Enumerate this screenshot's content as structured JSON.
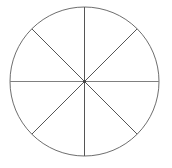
{
  "figure": {
    "name": "fraction-circle-eighths",
    "type": "geometric-diagram",
    "background_color": "#ffffff",
    "width": 172,
    "height": 168,
    "labels": [],
    "title": "",
    "circle": {
      "center_x": 84.5,
      "center_y": 81.5,
      "radius": 74.5,
      "stroke_color": "#6e6e6e",
      "stroke_width": 1,
      "fill_color": "none"
    },
    "sectors": {
      "count": 8,
      "sector_angle_degrees": 45,
      "shaded_count": 0,
      "fill_color": "none"
    },
    "diameters": [
      {
        "name": "vertical-diameter",
        "angle_degrees": 90,
        "x1": 84.5,
        "y1": 7.0,
        "x2": 84.5,
        "y2": 156.0,
        "stroke_color": "#555555",
        "stroke_width": 1
      },
      {
        "name": "horizontal-diameter",
        "angle_degrees": 0,
        "x1": 10.0,
        "y1": 81.5,
        "x2": 159.0,
        "y2": 81.5,
        "stroke_color": "#808080",
        "stroke_width": 1
      },
      {
        "name": "diagonal-diameter-nw-se",
        "angle_degrees": 135,
        "x1": 31.8,
        "y1": 28.8,
        "x2": 137.2,
        "y2": 134.2,
        "stroke_color": "#555555",
        "stroke_width": 1
      },
      {
        "name": "diagonal-diameter-ne-sw",
        "angle_degrees": 45,
        "x1": 137.2,
        "y1": 28.8,
        "x2": 31.8,
        "y2": 134.2,
        "stroke_color": "#555555",
        "stroke_width": 1
      }
    ],
    "center_dot": {
      "name": "center-point",
      "x": 84.5,
      "y": 81.5,
      "radius": 1.6,
      "color": "#444444"
    }
  }
}
